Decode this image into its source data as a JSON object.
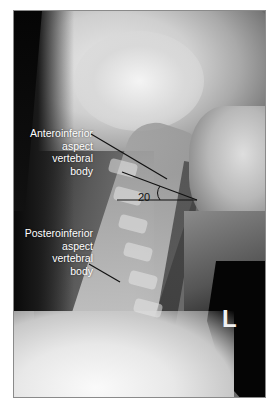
{
  "figure": {
    "type": "lateral cervical spine radiograph",
    "labels": {
      "anterior": [
        "Anteroinferior",
        "aspect",
        "vertebral",
        "body"
      ],
      "posterior": [
        "Posteroinferior",
        "aspect",
        "vertebral",
        "body"
      ]
    },
    "angle_label": "20",
    "side_marker": "L",
    "colors": {
      "frame_border": "#8a8a8a",
      "annotation_line": "#111111",
      "label_text": "#ffffff"
    }
  }
}
